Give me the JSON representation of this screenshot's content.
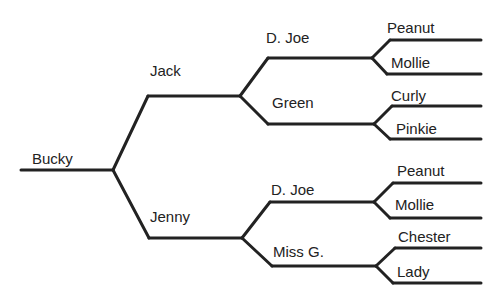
{
  "diagram": {
    "type": "pedigree-tree",
    "line_color": "#222222",
    "text_color": "#222222",
    "nodes": [
      {
        "id": "bucky",
        "label": "Bucky",
        "generation": 0,
        "label_x": 32,
        "label_y": 151,
        "line": [
          21,
          170,
          113,
          170
        ]
      },
      {
        "id": "jack",
        "label": "Jack",
        "generation": 1,
        "parent": "bucky",
        "label_x": 150,
        "label_y": 63,
        "line": [
          148,
          96,
          240,
          96
        ]
      },
      {
        "id": "jenny",
        "label": "Jenny",
        "generation": 1,
        "parent": "bucky",
        "label_x": 150,
        "label_y": 209,
        "line": [
          149,
          238,
          242,
          238
        ]
      },
      {
        "id": "djoe1",
        "label": "D. Joe",
        "generation": 2,
        "parent": "jack",
        "label_x": 266,
        "label_y": 30,
        "line": [
          268,
          58,
          372,
          58
        ]
      },
      {
        "id": "green",
        "label": "Green",
        "generation": 2,
        "parent": "jack",
        "label_x": 272,
        "label_y": 95,
        "line": [
          268,
          124,
          374,
          124
        ]
      },
      {
        "id": "djoe2",
        "label": "D. Joe",
        "generation": 2,
        "parent": "jenny",
        "label_x": 271,
        "label_y": 182,
        "line": [
          270,
          202,
          374,
          202
        ]
      },
      {
        "id": "missg",
        "label": "Miss G.",
        "generation": 2,
        "parent": "jenny",
        "label_x": 273,
        "label_y": 244,
        "line": [
          272,
          266,
          376,
          266
        ]
      },
      {
        "id": "peanut1",
        "label": "Peanut",
        "generation": 3,
        "parent": "djoe1",
        "label_x": 387,
        "label_y": 20,
        "line": [
          390,
          40,
          481,
          40
        ]
      },
      {
        "id": "mollie1",
        "label": "Mollie",
        "generation": 3,
        "parent": "djoe1",
        "label_x": 391,
        "label_y": 55,
        "line": [
          387,
          74,
          481,
          74
        ]
      },
      {
        "id": "curly",
        "label": "Curly",
        "generation": 3,
        "parent": "green",
        "label_x": 391,
        "label_y": 88,
        "line": [
          392,
          106,
          481,
          106
        ]
      },
      {
        "id": "pinkie",
        "label": "Pinkie",
        "generation": 3,
        "parent": "green",
        "label_x": 396,
        "label_y": 121,
        "line": [
          390,
          139,
          481,
          139
        ]
      },
      {
        "id": "peanut2",
        "label": "Peanut",
        "generation": 3,
        "parent": "djoe2",
        "label_x": 397,
        "label_y": 163,
        "line": [
          393,
          183,
          481,
          183
        ]
      },
      {
        "id": "mollie2",
        "label": "Mollie",
        "generation": 3,
        "parent": "djoe2",
        "label_x": 395,
        "label_y": 197,
        "line": [
          390,
          218,
          481,
          218
        ]
      },
      {
        "id": "chester",
        "label": "Chester",
        "generation": 3,
        "parent": "missg",
        "label_x": 398,
        "label_y": 229,
        "line": [
          395,
          248,
          481,
          248
        ]
      },
      {
        "id": "lady",
        "label": "Lady",
        "generation": 3,
        "parent": "missg",
        "label_x": 397,
        "label_y": 264,
        "line": [
          393,
          283,
          481,
          283
        ]
      }
    ]
  }
}
